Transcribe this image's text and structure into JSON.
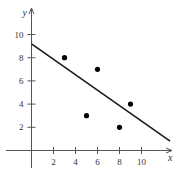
{
  "chart_data": {
    "type": "scatter",
    "title": "",
    "xlabel": "x",
    "ylabel": "y",
    "x_ticks": [
      2,
      4,
      6,
      8,
      10
    ],
    "y_ticks": [
      2,
      4,
      6,
      8,
      10
    ],
    "xlim": [
      -1.5,
      12.8
    ],
    "ylim": [
      -1.5,
      11.5
    ],
    "grid": false,
    "legend": null,
    "series": [
      {
        "name": "points",
        "type": "scatter",
        "x": [
          3,
          6,
          5,
          8,
          9
        ],
        "y": [
          8,
          7,
          3,
          2,
          4
        ]
      },
      {
        "name": "fit line",
        "type": "line",
        "x": [
          0,
          12.6
        ],
        "y": [
          9.2,
          0.8
        ]
      }
    ]
  },
  "labels": {
    "x_axis": "x",
    "y_axis": "y",
    "x_tick_labels": [
      "2",
      "4",
      "6",
      "8",
      "10"
    ],
    "y_tick_labels": [
      "2",
      "4",
      "6",
      "8",
      "10"
    ]
  }
}
